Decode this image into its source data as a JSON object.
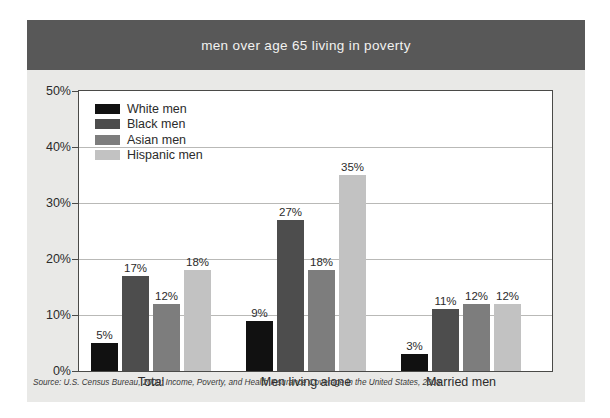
{
  "figure": {
    "title": "men over age 65 living in poverty",
    "source_note": "Source: U.S. Census Bureau, 2009; Income, Poverty, and Health Insurance Coverage in the United States, 2008.",
    "title_band_color": "#585858",
    "card_background": "#e9e9e7",
    "plot_background": "#ffffff",
    "frame_color": "#4a4a48",
    "gridline_color": "#b9b9b7"
  },
  "legend": {
    "position": "inside-top-left",
    "items": [
      {
        "label": "White men",
        "color": "#111111"
      },
      {
        "label": "Black men",
        "color": "#4d4d4d"
      },
      {
        "label": "Asian men",
        "color": "#7d7d7d"
      },
      {
        "label": "Hispanic men",
        "color": "#c2c2c2"
      }
    ]
  },
  "axis": {
    "y_ticks": [
      "0%",
      "10%",
      "20%",
      "30%",
      "40%",
      "50%"
    ],
    "y_tick_values": [
      0,
      10,
      20,
      30,
      40,
      50
    ]
  },
  "chart_data": {
    "type": "bar",
    "title": "men over age 65 living in poverty",
    "xlabel": "",
    "ylabel": "",
    "ylim": [
      0,
      50
    ],
    "ytick_step": 10,
    "yunit": "%",
    "grid": true,
    "legend_position": "inside-top-left",
    "categories": [
      "Total",
      "Men living alone",
      "Married men"
    ],
    "series": [
      {
        "name": "White men",
        "color": "#111111",
        "values": [
          5,
          9,
          3
        ]
      },
      {
        "name": "Black men",
        "color": "#4d4d4d",
        "values": [
          17,
          27,
          11
        ]
      },
      {
        "name": "Asian men",
        "color": "#7d7d7d",
        "values": [
          12,
          18,
          12
        ]
      },
      {
        "name": "Hispanic men",
        "color": "#c2c2c2",
        "values": [
          18,
          35,
          12
        ]
      }
    ],
    "data_labels": [
      [
        "5%",
        "17%",
        "12%",
        "18%"
      ],
      [
        "9%",
        "27%",
        "18%",
        "35%"
      ],
      [
        "3%",
        "11%",
        "12%",
        "12%"
      ]
    ],
    "annotations": [
      "Source: U.S. Census Bureau, 2009; Income, Poverty, and Health Insurance Coverage in the United States, 2008."
    ]
  }
}
